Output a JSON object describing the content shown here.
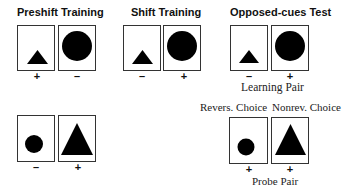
{
  "panels": {
    "preshift": {
      "title": "Preshift Training",
      "left_sign": "+",
      "right_sign": "–",
      "left_shape": "small-triangle",
      "right_shape": "large-circle"
    },
    "shift": {
      "title": "Shift Training",
      "left_sign": "–",
      "right_sign": "+",
      "left_shape": "small-triangle",
      "right_shape": "large-circle"
    },
    "opposed": {
      "title": "Opposed-cues Test",
      "left_sign": "–",
      "right_sign": "+",
      "left_shape": "small-triangle",
      "right_shape": "large-circle",
      "caption": "Learning Pair"
    },
    "preshift_bottom": {
      "left_sign": "–",
      "right_sign": "+",
      "left_shape": "small-circle",
      "right_shape": "large-triangle"
    },
    "probe": {
      "left_label": "Revers. Choice",
      "right_label": "Nonrev. Choice",
      "left_sign": "+",
      "right_sign": "+",
      "left_shape": "small-circle",
      "right_shape": "large-triangle",
      "caption": "Probe Pair"
    }
  },
  "colors": {
    "shape": "#000000",
    "border": "#333333"
  }
}
